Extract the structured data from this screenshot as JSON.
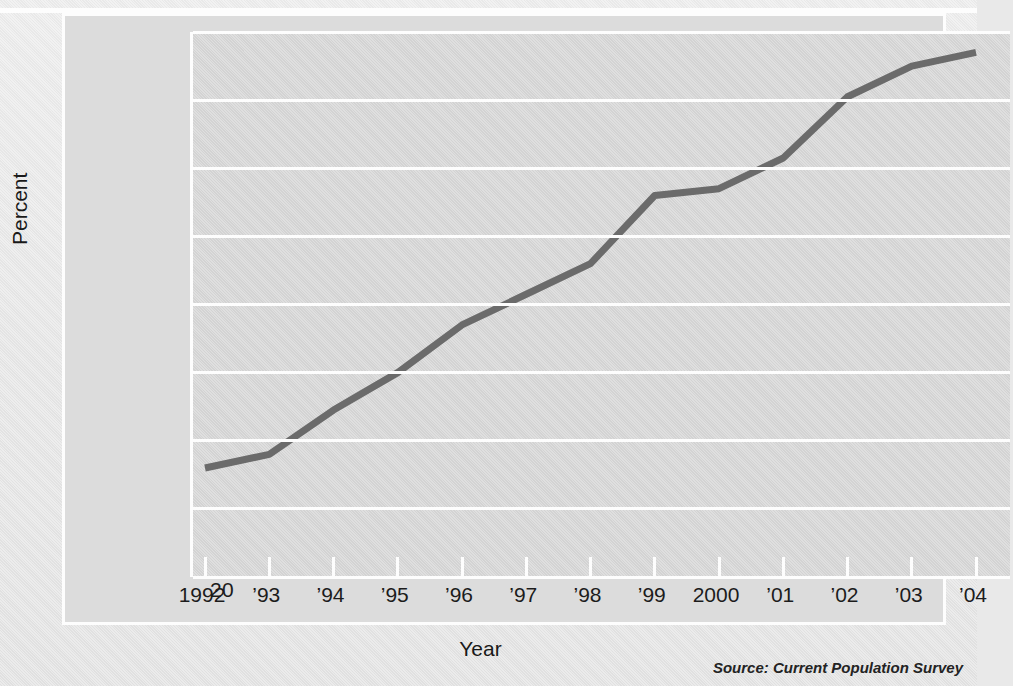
{
  "figure": {
    "source_note": "Source: Current Population Survey",
    "line_color": "#6b6b6b",
    "plot_background": "#d6d6d6",
    "grid_color": "#fdfdfd",
    "frame_color": "#fdfdfd",
    "page_background": "#e9e9e9"
  },
  "chart_data": {
    "type": "line",
    "title": "",
    "xlabel": "Year",
    "ylabel": "Percent",
    "categories": [
      "1992",
      "’93",
      "’94",
      "’95",
      "’96",
      "’97",
      "’98",
      "’99",
      "2000",
      "’01",
      "’02",
      "’03",
      "’04"
    ],
    "x": [
      1992,
      1993,
      1994,
      1995,
      1996,
      1997,
      1998,
      1999,
      2000,
      2001,
      2002,
      2003,
      2004
    ],
    "values": [
      21.6,
      21.8,
      22.45,
      23.0,
      23.7,
      24.15,
      24.6,
      25.6,
      25.7,
      26.15,
      27.05,
      27.5,
      27.7
    ],
    "ylim": [
      20,
      28
    ],
    "yticks": [
      20,
      21,
      22,
      23,
      24,
      25,
      26,
      27,
      28
    ],
    "ytick_labels": [
      "20",
      "21",
      "22",
      "23",
      "24",
      "25",
      "26",
      "27",
      "28"
    ],
    "grid": true,
    "grid_axis": "y",
    "legend": false,
    "legend_position": "none",
    "series": [
      {
        "name": "Percent",
        "values": [
          21.6,
          21.8,
          22.45,
          23.0,
          23.7,
          24.15,
          24.6,
          25.6,
          25.7,
          26.15,
          27.05,
          27.5,
          27.7
        ]
      }
    ]
  }
}
